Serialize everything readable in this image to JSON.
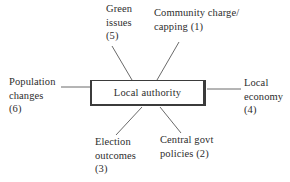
{
  "diagram": {
    "center_box": {
      "label": "Local authority"
    },
    "factors": [
      {
        "name": "green-issues",
        "label": "Green\nissues\n(5)",
        "rank": 5
      },
      {
        "name": "community-charge",
        "label": "Community charge/\ncapping (1)",
        "rank": 1
      },
      {
        "name": "population-changes",
        "label": "Population\nchanges\n(6)",
        "rank": 6
      },
      {
        "name": "local-economy",
        "label": "Local\neconomy\n(4)",
        "rank": 4
      },
      {
        "name": "election-outcomes",
        "label": "Election\noutcomes\n(3)",
        "rank": 3
      },
      {
        "name": "central-govt-policies",
        "label": "Central govt\npolicies (2)",
        "rank": 2
      }
    ],
    "colors": {
      "background": "#ffffff",
      "text": "#2d2d2d",
      "line": "#6a6a6a",
      "box_border": "#3b3b3b"
    }
  }
}
